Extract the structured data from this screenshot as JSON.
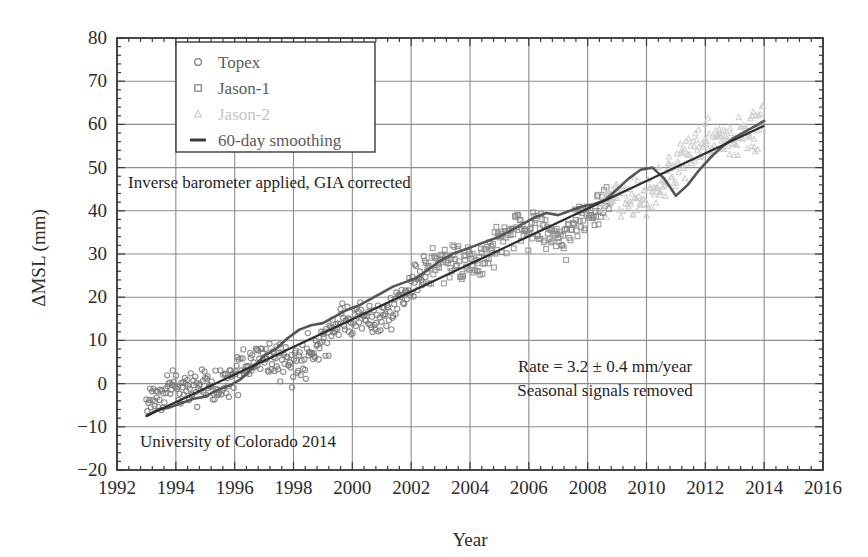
{
  "figure": {
    "background": "#ffffff",
    "frame_color": "#3a3a3a",
    "grid_color": "#8d8d8d"
  },
  "axes": {
    "x": {
      "title": "Year",
      "ticks": [
        "1992",
        "1994",
        "1996",
        "1998",
        "2000",
        "2002",
        "2004",
        "2006",
        "2008",
        "2010",
        "2012",
        "2014",
        "2016"
      ],
      "min": 1992,
      "max": 2016,
      "major_step": 2,
      "minor_per_major": 5
    },
    "y": {
      "title": "ΔMSL (mm)",
      "ticks": [
        "80",
        "70",
        "60",
        "50",
        "40",
        "30",
        "20",
        "10",
        "0",
        "-10",
        "-20"
      ],
      "min": -20,
      "max": 80,
      "major_step": 10,
      "minor_per_major": 5
    }
  },
  "legend": {
    "items": [
      {
        "label": "Topex",
        "marker": "circle-marker",
        "color": "#7a7a7a",
        "faint": false
      },
      {
        "label": "Jason-1",
        "marker": "square-marker",
        "color": "#7a7a7a",
        "faint": false
      },
      {
        "label": "Jason-2",
        "marker": "triangle-marker",
        "color": "#cdcdcd",
        "faint": true
      },
      {
        "label": "60-day smoothing",
        "marker": "line-marker",
        "color": "#3a3a3a",
        "faint": false
      }
    ],
    "box": {
      "x": 176,
      "y": 42,
      "width": 199,
      "height": 110
    }
  },
  "annotations": {
    "correction_note": "Inverse barometer applied, GIA corrected",
    "rate": "Rate = 3.2 ± 0.4 mm/year",
    "seasonal": "Seasonal signals removed",
    "source": "University of Colorado 2014"
  },
  "chart_data": {
    "type": "scatter",
    "title": "",
    "xlabel": "Year",
    "ylabel": "ΔMSL (mm)",
    "xlim": [
      1992,
      2016
    ],
    "ylim": [
      -20,
      80
    ],
    "grid": true,
    "legend_position": "top-left",
    "rate_mm_per_year": 3.2,
    "rate_uncertainty_mm_per_year": 0.4,
    "series": [
      {
        "name": "Topex",
        "marker": "circle",
        "color": "#7a7a7a",
        "x_range": [
          1993.0,
          2002.5
        ],
        "scatter_sd_mm": 3.4,
        "trend_intercept_mm": -7.5,
        "trend_start_year": 1993.0,
        "slope_mm_per_year": 3.2,
        "n_points": 330
      },
      {
        "name": "Jason-1",
        "marker": "square",
        "color": "#8a8a8a",
        "x_range": [
          2002.5,
          2008.8
        ],
        "scatter_sd_mm": 3.6,
        "trend_intercept_mm": -7.5,
        "trend_start_year": 1993.0,
        "slope_mm_per_year": 3.2,
        "n_points": 230
      },
      {
        "name": "Jason-2",
        "marker": "triangle",
        "color": "#cfcfcf",
        "x_range": [
          2008.5,
          2014.0
        ],
        "scatter_sd_mm": 3.8,
        "trend_intercept_mm": -7.5,
        "trend_start_year": 1993.0,
        "slope_mm_per_year": 3.2,
        "n_points": 200
      },
      {
        "name": "60-day smoothing",
        "marker": "line",
        "color": "#4a4a4a",
        "x_range": [
          1993.0,
          2014.0
        ],
        "description": "Smoothed curve following the trend with interannual wiggles, notably a dip near 2010-2011 down to about 43 mm before recovering."
      }
    ],
    "trend_line": {
      "name": "linear trend",
      "color": "#2e2e2e",
      "x": [
        1993.0,
        2014.0
      ],
      "y": [
        -7.5,
        59.7
      ]
    },
    "smoothing_curve_points": {
      "x": [
        1993.0,
        1993.4,
        1993.8,
        1994.2,
        1994.6,
        1995.0,
        1995.4,
        1995.8,
        1996.2,
        1996.6,
        1997.0,
        1997.4,
        1997.8,
        1998.2,
        1998.6,
        1999.0,
        1999.4,
        1999.8,
        2000.2,
        2000.6,
        2001.0,
        2001.4,
        2001.8,
        2002.2,
        2002.6,
        2003.0,
        2003.4,
        2003.8,
        2004.2,
        2004.6,
        2005.0,
        2005.4,
        2005.8,
        2006.2,
        2006.6,
        2007.0,
        2007.4,
        2007.8,
        2008.2,
        2008.6,
        2009.0,
        2009.4,
        2009.8,
        2010.2,
        2010.6,
        2011.0,
        2011.4,
        2011.8,
        2012.2,
        2012.6,
        2013.0,
        2013.4,
        2013.8,
        2014.0
      ],
      "y": [
        -7.5,
        -6.0,
        -5.5,
        -4.5,
        -3.5,
        -3.0,
        -1.5,
        -0.5,
        1.0,
        3.5,
        6.5,
        8.0,
        10.5,
        12.5,
        13.5,
        14.0,
        15.5,
        17.0,
        18.0,
        19.5,
        21.0,
        22.5,
        23.5,
        24.5,
        26.5,
        28.5,
        30.0,
        31.0,
        32.0,
        33.0,
        34.0,
        35.5,
        37.0,
        38.5,
        39.5,
        39.0,
        40.0,
        41.0,
        41.5,
        42.5,
        45.0,
        47.5,
        49.5,
        50.0,
        47.5,
        43.5,
        46.0,
        49.5,
        52.5,
        55.0,
        57.0,
        58.5,
        60.0,
        60.8
      ]
    }
  }
}
